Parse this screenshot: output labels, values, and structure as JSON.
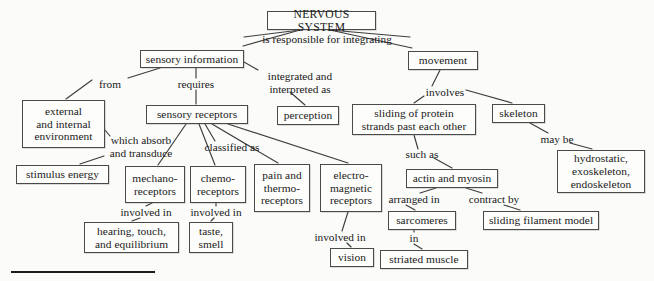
{
  "diagram": {
    "title": "NERVOUS SYSTEM",
    "type": "concept-map",
    "background_color": "#fbfbfa",
    "box_border_color": "#4a4a4a",
    "text_color": "#1a1a1a"
  },
  "nodes": [
    {
      "id": "nervous_system",
      "label": "NERVOUS SYSTEM",
      "x": 267,
      "y": 11,
      "w": 109,
      "h": 19
    },
    {
      "id": "sensory_info",
      "label": "sensory information",
      "x": 140,
      "y": 50,
      "w": 104,
      "h": 18
    },
    {
      "id": "movement",
      "label": "movement",
      "x": 408,
      "y": 51,
      "w": 70,
      "h": 19
    },
    {
      "id": "ext_int_env",
      "label": "external\nand internal\nenvironment",
      "x": 22,
      "y": 100,
      "w": 83,
      "h": 48
    },
    {
      "id": "sensory_receptors",
      "label": "sensory receptors",
      "x": 146,
      "y": 105,
      "w": 102,
      "h": 19
    },
    {
      "id": "perception",
      "label": "perception",
      "x": 277,
      "y": 106,
      "w": 62,
      "h": 19
    },
    {
      "id": "sliding_protein",
      "label": "sliding of protein\nstrands past each other",
      "x": 352,
      "y": 104,
      "w": 124,
      "h": 31
    },
    {
      "id": "skeleton",
      "label": "skeleton",
      "x": 492,
      "y": 104,
      "w": 53,
      "h": 19
    },
    {
      "id": "stimulus_energy",
      "label": "stimulus energy",
      "x": 16,
      "y": 165,
      "w": 93,
      "h": 19
    },
    {
      "id": "mechanoreceptors",
      "label": "mechano-\nreceptors",
      "x": 125,
      "y": 166,
      "w": 60,
      "h": 37
    },
    {
      "id": "chemoreceptors",
      "label": "chemo-\nreceptors",
      "x": 190,
      "y": 166,
      "w": 56,
      "h": 37
    },
    {
      "id": "pain_thermo",
      "label": "pain and\nthermo-\nreceptors",
      "x": 254,
      "y": 164,
      "w": 56,
      "h": 48
    },
    {
      "id": "electromagnetic",
      "label": "electro-\nmagnetic\nreceptors",
      "x": 320,
      "y": 164,
      "w": 62,
      "h": 48
    },
    {
      "id": "hydrostatic",
      "label": "hydrostatic,\nexoskeleton,\nendoskeleton",
      "x": 557,
      "y": 150,
      "w": 88,
      "h": 43
    },
    {
      "id": "actin_myosin",
      "label": "actin and myosin",
      "x": 406,
      "y": 169,
      "w": 92,
      "h": 19
    },
    {
      "id": "hearing_touch",
      "label": "hearing, touch,\nand equilibrium",
      "x": 84,
      "y": 222,
      "w": 95,
      "h": 31
    },
    {
      "id": "taste_smell",
      "label": "taste,\nsmell",
      "x": 189,
      "y": 222,
      "w": 44,
      "h": 31
    },
    {
      "id": "sarcomeres",
      "label": "sarcomeres",
      "x": 388,
      "y": 211,
      "w": 68,
      "h": 19
    },
    {
      "id": "sliding_filament",
      "label": "sliding filament model",
      "x": 483,
      "y": 211,
      "w": 116,
      "h": 19
    },
    {
      "id": "vision",
      "label": "vision",
      "x": 330,
      "y": 248,
      "w": 44,
      "h": 19
    },
    {
      "id": "striated_muscle",
      "label": "striated muscle",
      "x": 380,
      "y": 250,
      "w": 88,
      "h": 19
    }
  ],
  "link_labels": [
    {
      "id": "responsible",
      "text": "is responsible for integrating",
      "x": 243,
      "y": 33,
      "w": 168
    },
    {
      "id": "from",
      "text": "from",
      "x": 92,
      "y": 78,
      "w": 36
    },
    {
      "id": "requires",
      "text": "requires",
      "x": 169,
      "y": 78,
      "w": 54
    },
    {
      "id": "integrated",
      "text": "integrated and\ninterpreted as",
      "x": 255,
      "y": 70,
      "w": 90
    },
    {
      "id": "involves",
      "text": "involves",
      "x": 419,
      "y": 86,
      "w": 52
    },
    {
      "id": "which_absorb",
      "text": "which absorb\nand transduce",
      "x": 97,
      "y": 134,
      "w": 88
    },
    {
      "id": "classified_as",
      "text": "classified as",
      "x": 194,
      "y": 141,
      "w": 76
    },
    {
      "id": "may_be",
      "text": "may be",
      "x": 534,
      "y": 133,
      "w": 46
    },
    {
      "id": "such_as",
      "text": "such as",
      "x": 398,
      "y": 148,
      "w": 48
    },
    {
      "id": "involved_in_1",
      "text": "involved in",
      "x": 112,
      "y": 206,
      "w": 68
    },
    {
      "id": "involved_in_2",
      "text": "involved in",
      "x": 182,
      "y": 206,
      "w": 68
    },
    {
      "id": "arranged_in",
      "text": "arranged in",
      "x": 379,
      "y": 193,
      "w": 70
    },
    {
      "id": "contract_by",
      "text": "contract by",
      "x": 460,
      "y": 193,
      "w": 68
    },
    {
      "id": "involved_in_3",
      "text": "involved in",
      "x": 306,
      "y": 231,
      "w": 68
    },
    {
      "id": "in",
      "text": "in",
      "x": 404,
      "y": 232,
      "w": 20
    }
  ],
  "edges": [
    {
      "id": "ns-sensory",
      "from": "nervous_system",
      "to": "sensory_info",
      "points": "300,30 243,46"
    },
    {
      "id": "ns-movement",
      "from": "nervous_system",
      "to": "movement",
      "points": "330,30 412,48"
    },
    {
      "id": "ns-responsible-l",
      "from": "nervous_system",
      "to": "responsible",
      "points": "300,30 244,37"
    },
    {
      "id": "ns-responsible-r",
      "from": "nervous_system",
      "to": "responsible",
      "points": "330,30 410,37"
    },
    {
      "id": "sensory-from",
      "from": "sensory_info",
      "to": "from",
      "points": "160,68 128,78"
    },
    {
      "id": "from-env",
      "from": "from",
      "to": "ext_int_env",
      "points": "92,80 66,99"
    },
    {
      "id": "sensory-requires",
      "from": "sensory_info",
      "to": "requires",
      "points": "196,68 196,78"
    },
    {
      "id": "requires-receptors",
      "from": "requires",
      "to": "sensory_receptors",
      "points": "196,90 196,104"
    },
    {
      "id": "sensory-integrated",
      "from": "sensory_info",
      "to": "integrated",
      "points": "244,62 258,70"
    },
    {
      "id": "integrated-perception",
      "from": "integrated",
      "to": "perception",
      "points": "290,92 305,105"
    },
    {
      "id": "movement-involves",
      "from": "movement",
      "to": "involves",
      "points": "440,70 432,86"
    },
    {
      "id": "involves-sliding",
      "from": "involves",
      "to": "sliding_protein",
      "points": "424,96 414,103"
    },
    {
      "id": "involves-skeleton",
      "from": "involves",
      "to": "skeleton",
      "points": "466,90 512,103"
    },
    {
      "id": "env-absorb",
      "from": "ext_int_env",
      "to": "which_absorb",
      "points": "105,130 110,136"
    },
    {
      "id": "absorb-stimulus",
      "from": "which_absorb",
      "to": "stimulus_energy",
      "points": "104,156 80,164"
    },
    {
      "id": "recep-classified",
      "from": "sensory_receptors",
      "to": "classified_as",
      "points": "205,124 215,141"
    },
    {
      "id": "recep-mechano",
      "from": "sensory_receptors",
      "to": "mechanoreceptors",
      "points": "186,124 158,165"
    },
    {
      "id": "recep-chemo",
      "from": "sensory_receptors",
      "to": "chemoreceptors",
      "points": "199,124 215,165"
    },
    {
      "id": "recep-pain",
      "from": "sensory_receptors",
      "to": "pain_thermo",
      "points": "212,124 278,163"
    },
    {
      "id": "recep-em",
      "from": "sensory_receptors",
      "to": "electromagnetic",
      "points": "228,124 348,163"
    },
    {
      "id": "skeleton-maybe",
      "from": "skeleton",
      "to": "may_be",
      "points": "530,123 548,133"
    },
    {
      "id": "maybe-hydro",
      "from": "may_be",
      "to": "hydrostatic",
      "points": "570,143 592,149"
    },
    {
      "id": "sliding-suchas",
      "from": "sliding_protein",
      "to": "such_as",
      "points": "414,135 418,149"
    },
    {
      "id": "suchas-actin",
      "from": "such_as",
      "to": "actin_myosin",
      "points": "434,158 452,168"
    },
    {
      "id": "mech-involved",
      "from": "mechanoreceptors",
      "to": "involved_in_1",
      "points": "152,203 146,206"
    },
    {
      "id": "involved1-hearing",
      "from": "involved_in_1",
      "to": "hearing_touch",
      "points": "140,218 132,221"
    },
    {
      "id": "chemo-involved",
      "from": "chemoreceptors",
      "to": "involved_in_2",
      "points": "216,203 216,206"
    },
    {
      "id": "involved2-taste",
      "from": "involved_in_2",
      "to": "taste_smell",
      "points": "214,218 211,221"
    },
    {
      "id": "em-involved",
      "from": "electromagnetic",
      "to": "involved_in_3",
      "points": "348,212 342,231"
    },
    {
      "id": "involved3-vision",
      "from": "involved_in_3",
      "to": "vision",
      "points": "347,243 351,247"
    },
    {
      "id": "actin-arranged",
      "from": "actin_myosin",
      "to": "arranged_in",
      "points": "436,188 420,193"
    },
    {
      "id": "arranged-sarco",
      "from": "arranged_in",
      "to": "sarcomeres",
      "points": "406,205 415,210"
    },
    {
      "id": "actin-contract",
      "from": "actin_myosin",
      "to": "contract_by",
      "points": "466,188 482,193"
    },
    {
      "id": "contract-filament",
      "from": "contract_by",
      "to": "sliding_filament",
      "points": "504,205 520,210"
    },
    {
      "id": "sarco-in",
      "from": "sarcomeres",
      "to": "in",
      "points": "414,230 414,232"
    },
    {
      "id": "in-striated",
      "from": "in",
      "to": "striated_muscle",
      "points": "414,244 422,249"
    }
  ],
  "baseline_rule": {
    "x": 11,
    "y": 271,
    "w": 144,
    "h": 2
  }
}
